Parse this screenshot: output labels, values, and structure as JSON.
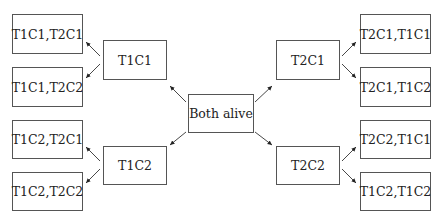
{
  "diagram": {
    "root": {
      "id": "both_alive",
      "label": "Both alive"
    },
    "level1": [
      {
        "id": "t1c1",
        "label": "T1C1"
      },
      {
        "id": "t1c2",
        "label": "T1C2"
      },
      {
        "id": "t2c1",
        "label": "T2C1"
      },
      {
        "id": "t2c2",
        "label": "T2C2"
      }
    ],
    "leaves": [
      {
        "parent": "t1c1",
        "label": "T1C1,T2C1"
      },
      {
        "parent": "t1c1",
        "label": "T1C1,T2C2"
      },
      {
        "parent": "t1c2",
        "label": "T1C2,T2C1"
      },
      {
        "parent": "t1c2",
        "label": "T1C2,T2C2"
      },
      {
        "parent": "t2c1",
        "label": "T2C1,T1C1"
      },
      {
        "parent": "t2c1",
        "label": "T2C1,T1C2"
      },
      {
        "parent": "t2c2",
        "label": "T2C2,T1C1"
      },
      {
        "parent": "t2c2",
        "label": "T1C2,T1C2"
      }
    ],
    "colors": {
      "border": "#555555",
      "text": "#222222",
      "arrow": "#222222",
      "background": "#ffffff"
    }
  }
}
